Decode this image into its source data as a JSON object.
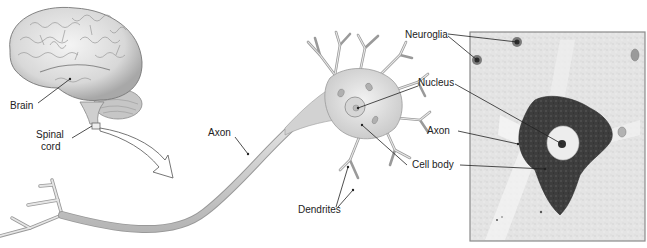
{
  "figure": {
    "panels": {
      "brain": {
        "labels": {
          "brain": "Brain",
          "spinal_cord_line1": "Spinal",
          "spinal_cord_line2": "cord"
        }
      },
      "neuron_illustration": {
        "labels": {
          "axon": "Axon",
          "dendrites": "Dendrites"
        }
      },
      "micrograph": {
        "labels": {
          "neuroglia": "Neuroglia",
          "nucleus": "Nucleus",
          "axon": "Axon",
          "cell_body": "Cell body"
        }
      }
    },
    "colors": {
      "background": "#ffffff",
      "illustration_fill": "#d9d9d9",
      "illustration_stroke": "#8c8c8c",
      "micrograph_background": "#e6e6e6",
      "micrograph_cell": "#3c3c3c",
      "leader_line": "#222222",
      "frame": "#8a8a8a"
    }
  }
}
